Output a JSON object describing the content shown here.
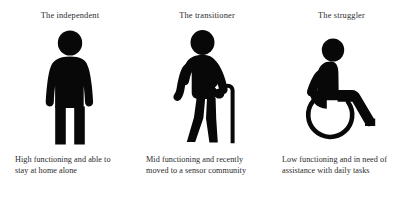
{
  "figure": {
    "type": "persona-diagram",
    "background_color": "#ffffff",
    "ink_color": "#080808",
    "text_color": "#2a2a2a",
    "columns": [
      {
        "heading": "The independent",
        "icon": "standing-person-icon",
        "caption_lines": [
          "High functioning and able to",
          "stay at home alone"
        ],
        "caption": "High functioning and able to stay at home alone"
      },
      {
        "heading": "The transitioner",
        "icon": "person-with-cane-icon",
        "caption_lines": [
          "Mid functioning and recently",
          "moved to a sensor community"
        ],
        "caption": "Mid functioning and recently moved to a sensor community"
      },
      {
        "heading": "The struggler",
        "icon": "wheelchair-user-icon",
        "caption_lines": [
          "Low functioning and in need of",
          "assistance with daily tasks"
        ],
        "caption": "Low functioning and in need of assistance with daily tasks"
      }
    ]
  }
}
